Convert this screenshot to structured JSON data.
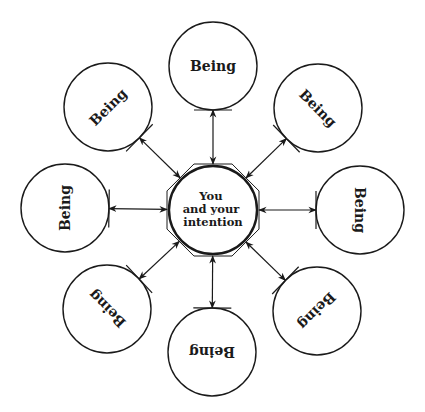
{
  "diagram": {
    "center": {
      "lines": [
        "You",
        "and your",
        "intention"
      ],
      "cx": 213,
      "cy": 210,
      "r": 44
    },
    "nodes": [
      {
        "label": "Being",
        "position": "top",
        "cx": 213,
        "cy": 66,
        "rotate": 0
      },
      {
        "label": "Being",
        "position": "top-right",
        "cx": 318,
        "cy": 108,
        "rotate": 45
      },
      {
        "label": "Being",
        "position": "right",
        "cx": 360,
        "cy": 210,
        "rotate": 90
      },
      {
        "label": "Being",
        "position": "bottom-right",
        "cx": 317,
        "cy": 311,
        "rotate": 135
      },
      {
        "label": "Being",
        "position": "bottom",
        "cx": 212,
        "cy": 352,
        "rotate": 180
      },
      {
        "label": "Being",
        "position": "bottom-left",
        "cx": 107,
        "cy": 309,
        "rotate": 225
      },
      {
        "label": "Being",
        "position": "left",
        "cx": 65,
        "cy": 208,
        "rotate": 270
      },
      {
        "label": "Being",
        "position": "top-left",
        "cx": 108,
        "cy": 107,
        "rotate": 315
      }
    ],
    "node_radius": 44,
    "stroke_color": "#1a1a1a",
    "background": "#ffffff"
  }
}
